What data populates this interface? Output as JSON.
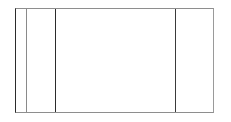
{
  "figure": {
    "kind": "empty-table-frame",
    "canvas": {
      "width": 231,
      "height": 122,
      "background_color": "#ffffff"
    },
    "frame": {
      "x": 15,
      "y": 8,
      "width": 199,
      "height": 105,
      "border_color_left": "#2b2b2b",
      "border_color_top": "#8e8e8e",
      "border_color_right": "#9a9a9a",
      "border_color_bottom": "#8e8e8e",
      "border_width": 1,
      "fill_color": "#ffffff"
    },
    "column_rules": [
      {
        "name": "rule-1",
        "x": 26,
        "color": "#8a8a8a",
        "width": 1
      },
      {
        "name": "rule-2",
        "x": 55,
        "color": "#2b2b2b",
        "width": 1
      },
      {
        "name": "rule-3",
        "x": 175,
        "color": "#3a3a3a",
        "width": 1
      }
    ],
    "columns": [
      {
        "name": "column-1",
        "x": 15,
        "width": 11,
        "text": ""
      },
      {
        "name": "column-2",
        "x": 26,
        "width": 29,
        "text": ""
      },
      {
        "name": "column-3",
        "x": 55,
        "width": 120,
        "text": ""
      },
      {
        "name": "column-4",
        "x": 175,
        "width": 39,
        "text": ""
      }
    ],
    "row_rules": []
  }
}
